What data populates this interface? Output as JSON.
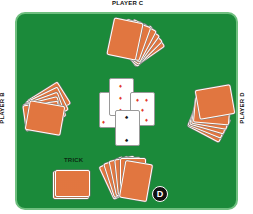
{
  "players": {
    "top": "PLAYER C",
    "left": "PLAYER B",
    "right": "PLAYER D"
  },
  "trick_label": "TRICK",
  "dealer_badge": "D",
  "colors": {
    "felt": "#1b8a3a",
    "felt_border": "#6fbf7f",
    "card_back": "#e8804a",
    "red_suit": "#e23a2a",
    "black_suit": "#111111"
  },
  "center_cards": [
    {
      "suit": "diamond",
      "symbol": "♦",
      "color": "red"
    },
    {
      "suit": "diamond",
      "symbol": "♦",
      "color": "red"
    },
    {
      "suit": "diamond",
      "symbol": "♦",
      "color": "red"
    },
    {
      "suit": "spade",
      "symbol": "♠",
      "color": "black"
    }
  ]
}
